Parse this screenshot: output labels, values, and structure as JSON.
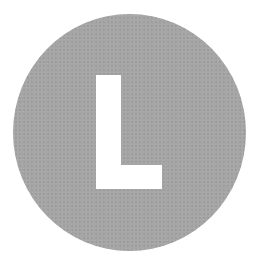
{
  "badge": {
    "letter": "L",
    "shape": "circle",
    "background_color": "#a6a6a6",
    "letter_color": "#ffffff"
  }
}
